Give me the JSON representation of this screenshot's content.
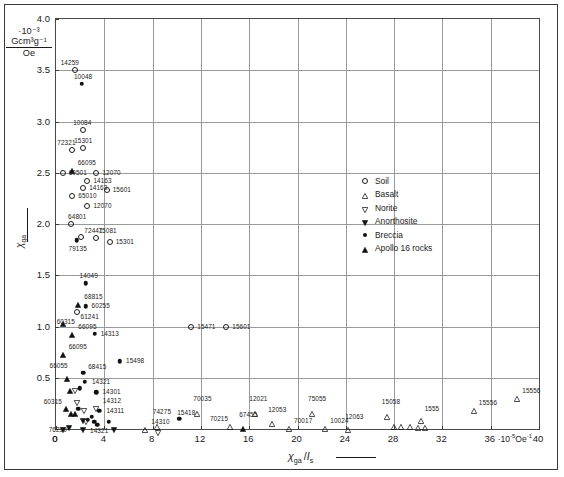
{
  "chart_data": {
    "type": "scatter",
    "title": "",
    "xlabel": "χga /Is",
    "ylabel": "χga",
    "x_unit": "·10⁻⁵ Oe⁻¹",
    "y_unit_numerator": "Gcm³g⁻¹",
    "y_unit_denominator": "Oe",
    "y_unit_prefix": "·10⁻³",
    "xlim": [
      0,
      40
    ],
    "ylim": [
      0,
      4.0
    ],
    "xticks": [
      0,
      4,
      8,
      12,
      16,
      20,
      24,
      28,
      32,
      36,
      40
    ],
    "yticks": [
      0,
      0.5,
      1.0,
      1.5,
      2.0,
      2.5,
      3.0,
      3.5,
      4.0
    ],
    "xticklabels": [
      "0",
      "4",
      "8",
      "12",
      "16",
      "20",
      "24",
      "28",
      "32",
      "36",
      "40"
    ],
    "yticklabels": [
      "0",
      "0.5",
      "1.0",
      "1.5",
      "2.0",
      "2.5",
      "3.0",
      "3.5",
      "4.0"
    ],
    "grid": true,
    "grid_spacing_x": 4,
    "grid_spacing_y": 0.5,
    "legend_position": "right-middle",
    "legend": [
      {
        "label": "Soil",
        "marker": "open-circle"
      },
      {
        "label": "Basalt",
        "marker": "open-triangle-up"
      },
      {
        "label": "Norite",
        "marker": "open-triangle-down"
      },
      {
        "label": "Anorthosite",
        "marker": "filled-triangle-down"
      },
      {
        "label": "Breccia",
        "marker": "filled-circle"
      },
      {
        "label": "Apollo 16 rocks",
        "marker": "filled-triangle-up"
      }
    ],
    "points": [
      {
        "label": "14259",
        "x": 1.55,
        "y": 3.5,
        "marker": "open-circle",
        "lx": -14,
        "ly": -11
      },
      {
        "label": "10048",
        "x": 2.15,
        "y": 3.37,
        "marker": "filled-circle",
        "lx": -8,
        "ly": -11
      },
      {
        "label": "10084",
        "x": 2.25,
        "y": 2.92,
        "marker": "open-circle",
        "lx": -10,
        "ly": -11
      },
      {
        "label": "72321",
        "x": 1.35,
        "y": 2.72,
        "marker": "open-circle",
        "lx": -15,
        "ly": -11
      },
      {
        "label": "15301",
        "x": 2.25,
        "y": 2.74,
        "marker": "open-circle",
        "lx": -9,
        "ly": -11
      },
      {
        "label": "66095",
        "x": 1.3,
        "y": 2.6,
        "marker": "filled-triangle-up",
        "lx": 6,
        "ly": -4
      },
      {
        "label": "60501",
        "x": 0.55,
        "y": 2.5,
        "marker": "open-circle",
        "lx": 6,
        "ly": -4
      },
      {
        "label": "12070",
        "x": 3.35,
        "y": 2.5,
        "marker": "open-circle",
        "lx": 6,
        "ly": -4
      },
      {
        "label": "14163",
        "x": 2.6,
        "y": 2.42,
        "marker": "open-circle",
        "lx": 6,
        "ly": -4
      },
      {
        "label": "14163",
        "x": 2.25,
        "y": 2.35,
        "marker": "open-circle",
        "lx": 6,
        "ly": -4
      },
      {
        "label": "15601",
        "x": 4.2,
        "y": 2.33,
        "marker": "open-circle",
        "lx": 6,
        "ly": -4
      },
      {
        "label": "65010",
        "x": 1.35,
        "y": 2.27,
        "marker": "open-circle",
        "lx": 6,
        "ly": -4
      },
      {
        "label": "12070",
        "x": 2.6,
        "y": 2.18,
        "marker": "open-circle",
        "lx": 6,
        "ly": -4
      },
      {
        "label": "64801",
        "x": 1.25,
        "y": 2.0,
        "marker": "open-circle",
        "lx": -3,
        "ly": -11
      },
      {
        "label": "72441",
        "x": 2.1,
        "y": 1.87,
        "marker": "open-circle",
        "lx": 3,
        "ly": -10
      },
      {
        "label": "75081",
        "x": 3.35,
        "y": 1.86,
        "marker": "open-circle",
        "lx": 2,
        "ly": -11
      },
      {
        "label": "15301",
        "x": 4.45,
        "y": 1.82,
        "marker": "open-circle",
        "lx": 6,
        "ly": -4
      },
      {
        "label": "79135",
        "x": 1.7,
        "y": 1.84,
        "marker": "filled-circle",
        "lx": -8,
        "ly": 5
      },
      {
        "label": "14049",
        "x": 2.45,
        "y": 1.42,
        "marker": "filled-circle",
        "lx": -6,
        "ly": -11
      },
      {
        "label": "68815",
        "x": 1.85,
        "y": 1.29,
        "marker": "filled-triangle-up",
        "lx": 6,
        "ly": -4
      },
      {
        "label": "60255",
        "x": 2.45,
        "y": 1.2,
        "marker": "filled-circle",
        "lx": 6,
        "ly": -4
      },
      {
        "label": "61241",
        "x": 1.7,
        "y": 1.14,
        "marker": "open-circle",
        "lx": 4,
        "ly": 1
      },
      {
        "label": "60315",
        "x": 0.55,
        "y": 1.1,
        "marker": "filled-triangle-up",
        "lx": -6,
        "ly": 2
      },
      {
        "label": "66095",
        "x": 1.35,
        "y": 1.0,
        "marker": "filled-triangle-up",
        "lx": 6,
        "ly": -4
      },
      {
        "label": "15471",
        "x": 11.2,
        "y": 1.0,
        "marker": "open-circle",
        "lx": 6,
        "ly": -4
      },
      {
        "label": "15601",
        "x": 14.1,
        "y": 1.0,
        "marker": "open-circle",
        "lx": 6,
        "ly": -4
      },
      {
        "label": "14313",
        "x": 3.2,
        "y": 0.93,
        "marker": "filled-circle",
        "lx": 6,
        "ly": -4
      },
      {
        "label": "66095",
        "x": 0.55,
        "y": 0.8,
        "marker": "filled-triangle-up",
        "lx": 6,
        "ly": -4
      },
      {
        "label": "15498",
        "x": 5.3,
        "y": 0.66,
        "marker": "filled-circle",
        "lx": 6,
        "ly": -4
      },
      {
        "label": "66055",
        "x": 0.95,
        "y": 0.57,
        "marker": "filled-triangle-up",
        "lx": -18,
        "ly": -9
      },
      {
        "label": "68415",
        "x": 2.25,
        "y": 0.55,
        "marker": "filled-circle",
        "lx": 0,
        "ly": -10
      },
      {
        "label": "14321",
        "x": 2.4,
        "y": 0.46,
        "marker": "filled-circle",
        "lx": 7,
        "ly": 0
      },
      {
        "label": "14301",
        "x": 3.35,
        "y": 0.36,
        "marker": "filled-circle",
        "lx": 6,
        "ly": -4
      },
      {
        "label": "60315",
        "x": 0.8,
        "y": 0.27,
        "marker": "filled-triangle-up",
        "lx": -22,
        "ly": -3
      },
      {
        "label": "14312",
        "x": 3.3,
        "y": 0.27,
        "marker": "open-triangle-down",
        "lx": 7,
        "ly": -4
      },
      {
        "label": "14311",
        "x": 3.6,
        "y": 0.18,
        "marker": "filled-circle",
        "lx": 7,
        "ly": -4
      },
      {
        "label": "14321",
        "x": 3.15,
        "y": 0.07,
        "marker": "filled-circle",
        "lx": -4,
        "ly": 5
      },
      {
        "label": "76230",
        "x": 0.55,
        "y": 0.07,
        "marker": "filled-triangle-down",
        "lx": -14,
        "ly": 4
      },
      {
        "label": "14310",
        "x": 7.4,
        "y": 0.07,
        "marker": "open-triangle-up",
        "lx": 6,
        "ly": -4
      },
      {
        "label": "74275",
        "x": 8.35,
        "y": 0.1,
        "marker": "open-triangle-up",
        "lx": -4,
        "ly": -11
      },
      {
        "label": "15418",
        "x": 10.2,
        "y": 0.1,
        "marker": "filled-circle",
        "lx": -2,
        "ly": -10
      },
      {
        "label": "70035",
        "x": 11.7,
        "y": 0.22,
        "marker": "open-triangle-up",
        "lx": -4,
        "ly": -11
      },
      {
        "label": "70215",
        "x": 14.4,
        "y": 0.1,
        "marker": "open-triangle-up",
        "lx": -20,
        "ly": -4
      },
      {
        "label": "67455",
        "x": 15.5,
        "y": 0.08,
        "marker": "filled-triangle-up",
        "lx": -4,
        "ly": -10
      },
      {
        "label": "12021",
        "x": 16.5,
        "y": 0.22,
        "marker": "open-triangle-up",
        "lx": -6,
        "ly": -11
      },
      {
        "label": "12053",
        "x": 17.9,
        "y": 0.13,
        "marker": "open-triangle-up",
        "lx": -4,
        "ly": -10
      },
      {
        "label": "70017",
        "x": 19.3,
        "y": 0.08,
        "marker": "open-triangle-up",
        "lx": 5,
        "ly": -4
      },
      {
        "label": "10024",
        "x": 22.3,
        "y": 0.08,
        "marker": "open-triangle-up",
        "lx": 5,
        "ly": -4
      },
      {
        "label": "75055",
        "x": 21.2,
        "y": 0.22,
        "marker": "open-triangle-up",
        "lx": -4,
        "ly": -11
      },
      {
        "label": "12063",
        "x": 24.2,
        "y": 0.07,
        "marker": "open-triangle-up",
        "lx": -3,
        "ly": -9
      },
      {
        "label": "15058",
        "x": 27.4,
        "y": 0.2,
        "marker": "open-triangle-up",
        "lx": -5,
        "ly": -11
      },
      {
        "label": "1555",
        "x": 30.2,
        "y": 0.16,
        "marker": "open-triangle-up",
        "lx": 4,
        "ly": -8
      },
      {
        "label": "15556",
        "x": 34.6,
        "y": 0.25,
        "marker": "open-triangle-up",
        "lx": 5,
        "ly": -4
      },
      {
        "label": "15556",
        "x": 38.2,
        "y": 0.37,
        "marker": "open-triangle-up",
        "lx": 5,
        "ly": -4
      }
    ],
    "extra_points": [
      {
        "x": 28.0,
        "y": 0.1,
        "marker": "open-triangle-up"
      },
      {
        "x": 28.6,
        "y": 0.1,
        "marker": "open-triangle-up"
      },
      {
        "x": 29.3,
        "y": 0.1,
        "marker": "open-triangle-up"
      },
      {
        "x": 30.0,
        "y": 0.09,
        "marker": "open-triangle-up"
      },
      {
        "x": 30.6,
        "y": 0.09,
        "marker": "open-triangle-up"
      },
      {
        "x": 1.15,
        "y": 0.45,
        "marker": "filled-triangle-up"
      },
      {
        "x": 1.55,
        "y": 0.45,
        "marker": "open-triangle-down"
      },
      {
        "x": 1.95,
        "y": 0.4,
        "marker": "filled-circle"
      },
      {
        "x": 1.7,
        "y": 0.33,
        "marker": "open-triangle-down"
      },
      {
        "x": 1.25,
        "y": 0.22,
        "marker": "filled-triangle-up"
      },
      {
        "x": 1.55,
        "y": 0.22,
        "marker": "filled-triangle-up"
      },
      {
        "x": 1.85,
        "y": 0.2,
        "marker": "filled-circle"
      },
      {
        "x": 2.3,
        "y": 0.25,
        "marker": "open-triangle-down"
      },
      {
        "x": 2.2,
        "y": 0.16,
        "marker": "filled-triangle-down"
      },
      {
        "x": 2.5,
        "y": 0.15,
        "marker": "open-triangle-down"
      },
      {
        "x": 2.25,
        "y": 0.07,
        "marker": "filled-triangle-down"
      },
      {
        "x": 2.65,
        "y": 0.09,
        "marker": "filled-circle"
      },
      {
        "x": 2.95,
        "y": 0.12,
        "marker": "filled-circle"
      },
      {
        "x": 1.05,
        "y": 0.09,
        "marker": "filled-triangle-down"
      },
      {
        "x": 4.35,
        "y": 0.07,
        "marker": "filled-circle"
      },
      {
        "x": 4.8,
        "y": 0.07,
        "marker": "filled-triangle-down"
      },
      {
        "x": 8.45,
        "y": 0.04,
        "marker": "open-triangle-down"
      },
      {
        "x": 3.4,
        "y": 0.04,
        "marker": "filled-circle"
      }
    ]
  }
}
